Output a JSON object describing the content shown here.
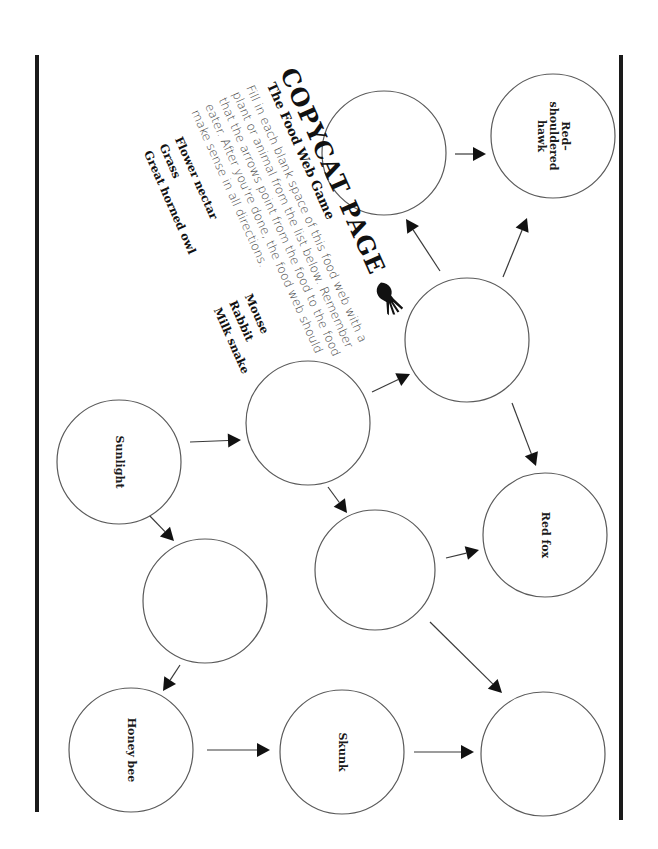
{
  "page": {
    "title": "COPYCAT PAGE",
    "subtitle": "The Food Web Game",
    "instructions": "Fill in each blank space of this food web with a plant or animal from the list below. Remember that the arrows point from the food to the food eater. After you're done, the food web should make sense in all directions.",
    "icon": "skeleton-hand-icon"
  },
  "word_list": {
    "column_1": [
      "Flower nectar",
      "Grass",
      "Great horned owl"
    ],
    "column_2": [
      "Mouse",
      "Rabbit",
      "Milk snake"
    ]
  },
  "nodes": [
    {
      "id": "hawk",
      "label": "Red–\nshouldered\nhawk",
      "cx": 553,
      "cy": 136,
      "r": 62,
      "filled": true
    },
    {
      "id": "blank_top",
      "label": "",
      "cx": 384,
      "cy": 153,
      "r": 62,
      "filled": false
    },
    {
      "id": "blank_center_right",
      "label": "",
      "cx": 467,
      "cy": 340,
      "r": 62,
      "filled": false
    },
    {
      "id": "blank_center_left",
      "label": "",
      "cx": 308,
      "cy": 423,
      "r": 62,
      "filled": false
    },
    {
      "id": "sunlight",
      "label": "Sunlight",
      "cx": 119,
      "cy": 462,
      "r": 62,
      "filled": true
    },
    {
      "id": "red_fox",
      "label": "Red fox",
      "cx": 545,
      "cy": 535,
      "r": 62,
      "filled": true
    },
    {
      "id": "blank_lower_middle",
      "label": "",
      "cx": 375,
      "cy": 570,
      "r": 60,
      "filled": false
    },
    {
      "id": "blank_lower_left",
      "label": "",
      "cx": 205,
      "cy": 601,
      "r": 62,
      "filled": false
    },
    {
      "id": "honey_bee",
      "label": "Honey bee",
      "cx": 131,
      "cy": 750,
      "r": 62,
      "filled": true
    },
    {
      "id": "skunk",
      "label": "Skunk",
      "cx": 342,
      "cy": 752,
      "r": 62,
      "filled": true
    },
    {
      "id": "blank_bottom_right",
      "label": "",
      "cx": 543,
      "cy": 754,
      "r": 62,
      "filled": false
    }
  ],
  "arrows": [
    {
      "from": "blank_top",
      "to": "hawk",
      "x1": 455,
      "y1": 154,
      "x2": 486,
      "y2": 154
    },
    {
      "from": "blank_center_right",
      "to": "blank_top",
      "x1": 440,
      "y1": 271,
      "x2": 406,
      "y2": 219
    },
    {
      "from": "blank_center_right",
      "to": "hawk",
      "x1": 503,
      "y1": 277,
      "x2": 527,
      "y2": 218
    },
    {
      "from": "blank_center_left",
      "to": "blank_center_right",
      "x1": 372,
      "y1": 392,
      "x2": 410,
      "y2": 374
    },
    {
      "from": "sunlight",
      "to": "blank_center_left",
      "x1": 190,
      "y1": 442,
      "x2": 241,
      "y2": 440
    },
    {
      "from": "blank_center_right",
      "to": "red_fox",
      "x1": 512,
      "y1": 403,
      "x2": 536,
      "y2": 466
    },
    {
      "from": "blank_center_left",
      "to": "blank_lower_middle",
      "x1": 328,
      "y1": 487,
      "x2": 347,
      "y2": 513
    },
    {
      "from": "blank_lower_middle",
      "to": "red_fox",
      "x1": 446,
      "y1": 558,
      "x2": 479,
      "y2": 550
    },
    {
      "from": "blank_lower_middle",
      "to": "blank_bottom_right",
      "x1": 430,
      "y1": 622,
      "x2": 502,
      "y2": 693
    },
    {
      "from": "sunlight",
      "to": "blank_lower_left",
      "x1": 147,
      "y1": 513,
      "x2": 174,
      "y2": 541
    },
    {
      "from": "blank_lower_left",
      "to": "honey_bee",
      "x1": 180,
      "y1": 665,
      "x2": 163,
      "y2": 691
    },
    {
      "from": "honey_bee",
      "to": "skunk",
      "x1": 207,
      "y1": 750,
      "x2": 270,
      "y2": 750
    },
    {
      "from": "skunk",
      "to": "blank_bottom_right",
      "x1": 414,
      "y1": 752,
      "x2": 474,
      "y2": 752
    }
  ],
  "borders": [
    {
      "side": "left",
      "x": 37,
      "y1": 55,
      "y2": 812
    },
    {
      "side": "right",
      "x": 621,
      "y1": 55,
      "y2": 820
    }
  ],
  "colors": {
    "ink": "#111111",
    "circle_stroke": "#5a5a5a",
    "text_gray": "#444444",
    "paper": "#ffffff"
  }
}
